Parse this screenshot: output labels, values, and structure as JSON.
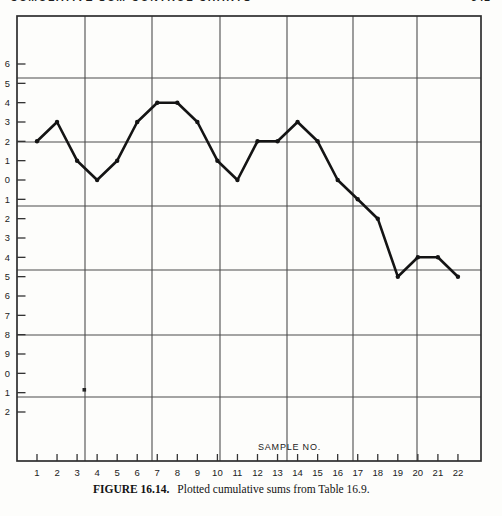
{
  "page": {
    "running_head_partial": "CUMULATIVE SUM CONTROL CHARTS",
    "page_number_partial": "541",
    "caption_label": "FIGURE 16.14.",
    "caption_text": "Plotted cumulative sums from Table 16.9."
  },
  "chart_data": {
    "type": "line",
    "title": "",
    "xlabel": "SAMPLE NO.",
    "ylabel": "",
    "x": [
      1,
      2,
      3,
      4,
      5,
      6,
      7,
      8,
      9,
      10,
      11,
      12,
      13,
      14,
      15,
      16,
      17,
      18,
      19,
      20,
      21,
      22
    ],
    "values": [
      0.02,
      0.03,
      0.01,
      0.0,
      0.01,
      0.03,
      0.04,
      0.04,
      0.03,
      0.01,
      0.0,
      0.02,
      0.02,
      0.03,
      0.02,
      0.0,
      -0.01,
      -0.02,
      -0.05,
      -0.04,
      -0.04,
      -0.05
    ],
    "x_tick_labels": [
      "1",
      "2",
      "3",
      "4",
      "5",
      "6",
      "7",
      "8",
      "9",
      "10",
      "11",
      "12",
      "13",
      "14",
      "15",
      "16",
      "17",
      "18",
      "19",
      "20",
      "21",
      "22"
    ],
    "y_ticks": [
      0.06,
      0.05,
      0.04,
      0.03,
      0.02,
      0.01,
      0.0,
      -0.01,
      -0.02,
      -0.03,
      -0.04,
      -0.05,
      -0.06,
      -0.07,
      -0.08,
      -0.09,
      -0.1,
      -0.11,
      -0.12
    ],
    "y_tick_labels_visible": [
      "6",
      "5",
      "4",
      "3",
      "2",
      "1",
      "0",
      "1",
      "2",
      "3",
      "4",
      "5",
      "6",
      "7",
      "8",
      "9",
      "0",
      "1",
      "2"
    ],
    "ylim": [
      -0.12,
      0.06
    ],
    "xlim": [
      1,
      22
    ],
    "grid": true,
    "legend": false,
    "marker": "filled-dot",
    "line_color": "#141414",
    "grid_color": "#4d4d4d",
    "border_color": "#2e2e2e"
  }
}
